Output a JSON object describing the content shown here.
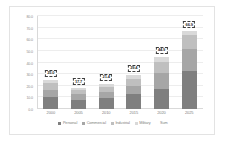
{
  "chart_data": {
    "type": "bar",
    "stacked": true,
    "title": "",
    "subtitle": "",
    "xlabel": "",
    "ylabel": "",
    "categories": [
      "2000",
      "2005",
      "2010",
      "2015",
      "2020",
      "2025"
    ],
    "series": [
      {
        "name": "Personal",
        "values": [
          10.2,
          8.1,
          9.4,
          12.6,
          17.2,
          33.0
        ],
        "color": "#7f7f7f"
      },
      {
        "name": "Commercial",
        "values": [
          6.5,
          4.8,
          5.6,
          7.4,
          14.0,
          18.2
        ],
        "color": "#a6a6a6"
      },
      {
        "name": "Industrial",
        "values": [
          5.8,
          3.1,
          4.0,
          5.6,
          9.6,
          12.1
        ],
        "color": "#bfbfbf"
      },
      {
        "name": "Military",
        "values": [
          2.5,
          1.7,
          2.4,
          3.8,
          4.1,
          3.6
        ],
        "color": "#d9d9d9"
      }
    ],
    "sum_label_name": "Sum",
    "sum_values": [
      "25.0",
      "17.7",
      "21.4",
      "29.4",
      "44.9",
      "66.9"
    ],
    "ylim": [
      0.0,
      80.0
    ],
    "ytick_step": 10.0,
    "yticks": [
      "80.0",
      "70.0",
      "60.0",
      "50.0",
      "40.0",
      "30.0",
      "20.0",
      "10.0",
      "0.0"
    ],
    "grid": true,
    "legend_position": "bottom",
    "legend": [
      "Personal",
      "Commercial",
      "Industrial",
      "Military",
      "Sum"
    ]
  }
}
